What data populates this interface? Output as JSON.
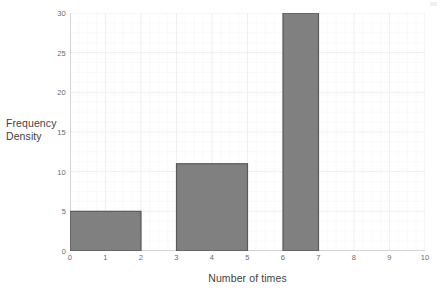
{
  "chart_data": {
    "type": "bar",
    "subtype": "histogram",
    "title": "",
    "xlabel": "Number of times",
    "ylabel": "Frequency Density",
    "ylabel_lines": [
      "Frequency",
      "Density"
    ],
    "xlim": [
      0,
      10
    ],
    "ylim": [
      0,
      30
    ],
    "x_ticks": [
      0,
      1,
      2,
      3,
      4,
      5,
      6,
      7,
      8,
      9,
      10
    ],
    "x_tick_labels": [
      "0",
      "1",
      "2",
      "3",
      "4",
      "5",
      "6",
      "7",
      "8",
      "9",
      "10"
    ],
    "y_ticks": [
      0,
      5,
      10,
      15,
      20,
      25,
      30
    ],
    "y_tick_labels": [
      "0",
      "5",
      "10",
      "15",
      "20",
      "25",
      "30"
    ],
    "grid": true,
    "minor_grid": true,
    "legend": false,
    "bars": [
      {
        "label": "0-2",
        "x_start": 0,
        "x_end": 2,
        "value": 5
      },
      {
        "label": "3-5",
        "x_start": 3,
        "x_end": 5,
        "value": 11
      },
      {
        "label": "6-7",
        "x_start": 6,
        "x_end": 7,
        "value": 30
      }
    ],
    "values": [
      5,
      11,
      30
    ],
    "categories": [
      "0-2",
      "3-5",
      "6-7"
    ]
  },
  "style": {
    "bar_fill": "#808080",
    "bar_stroke": "#595959",
    "axis_line": "#b0b0b0",
    "grid_major": "#ededed",
    "grid_minor": "#f6f6f6",
    "tick_text": "#6b6b6b",
    "axis_title_text": "#3f3f3f",
    "background": "#ffffff"
  }
}
